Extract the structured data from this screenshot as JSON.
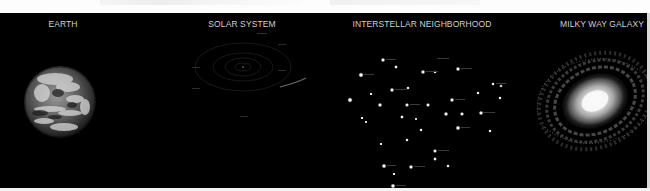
{
  "sections": [
    {
      "id": "earth",
      "label": "EARTH",
      "icon": "earth-globe"
    },
    {
      "id": "solar-system",
      "label": "SOLAR SYSTEM",
      "icon": "orbit-diagram"
    },
    {
      "id": "interstellar",
      "label": "INTERSTELLAR NEIGHBORHOOD",
      "icon": "star-field"
    },
    {
      "id": "galaxy",
      "label": "MILKY WAY GALAXY",
      "icon": "spiral-galaxy"
    }
  ],
  "colors": {
    "background": "#000000",
    "label": "#d0d0d0",
    "frame": "#ffffff"
  }
}
